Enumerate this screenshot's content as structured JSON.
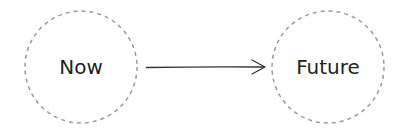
{
  "diagram": {
    "nodes": [
      {
        "id": "now",
        "label": "Now",
        "cx": 81,
        "cy": 67,
        "r": 56
      },
      {
        "id": "future",
        "label": "Future",
        "cx": 328,
        "cy": 67,
        "r": 56
      }
    ],
    "edges": [
      {
        "from": "now",
        "to": "future",
        "style": "arrow"
      }
    ],
    "colors": {
      "node_border": "#9a9a9a",
      "arrow": "#333333",
      "text": "#222222",
      "background": "#ffffff"
    }
  }
}
